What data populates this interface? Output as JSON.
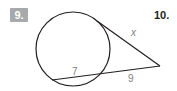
{
  "problems": [
    {
      "number_label": "9.",
      "style": "gray-badge"
    },
    {
      "number_label": "10.",
      "style": "bold-text"
    }
  ],
  "figure": {
    "type": "circle-tangent-secant",
    "circle": {
      "cx": 73,
      "cy": 49,
      "r": 37
    },
    "external_point": {
      "x": 160,
      "y": 66
    },
    "tangent_point": {
      "x": 97,
      "y": 21
    },
    "secant_far_point": {
      "x": 52,
      "y": 80
    },
    "secant_near_point": {
      "x": 98,
      "y": 74
    },
    "labels": {
      "tangent": "x",
      "internal_segment": "7",
      "external_segment": "9"
    },
    "colors": {
      "stroke": "#231f20",
      "label": "#808285",
      "badge": "#a7a9ac"
    }
  }
}
